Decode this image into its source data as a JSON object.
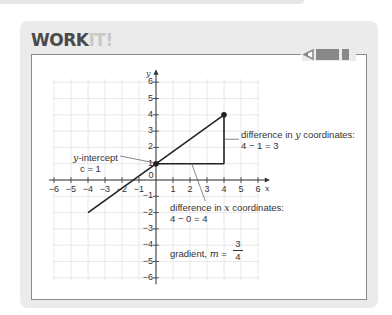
{
  "header": {
    "title_main": "WORK",
    "title_accent": "IT!"
  },
  "graph": {
    "x_axis_label": "x",
    "y_axis_label": "y",
    "x_ticks": [
      "−6",
      "−5",
      "−4",
      "−3",
      "−2",
      "−1",
      "0",
      "1",
      "2",
      "3",
      "4",
      "5",
      "6"
    ],
    "y_ticks": [
      "6",
      "5",
      "4",
      "3",
      "2",
      "1",
      "−1",
      "−2",
      "−3",
      "−4",
      "−5",
      "−6"
    ],
    "line_start": [
      -4,
      -2
    ],
    "line_end": [
      4,
      4
    ],
    "points": [
      [
        0,
        1
      ],
      [
        4,
        4
      ]
    ]
  },
  "annotations": {
    "y_intercept_line1": "y-intercept",
    "y_intercept_line2": "c = 1",
    "diff_y_line1": "difference in y coordinates:",
    "diff_y_line2": "4 − 1 = 3",
    "diff_x_line1": "difference in x coordinates:",
    "diff_x_line2": "4 − 0 = 4",
    "gradient_label": "gradient, m =",
    "gradient_num": "3",
    "gradient_den": "4"
  },
  "colors": {
    "card_bg": "#ebebeb",
    "title_dark": "#4a4a4a",
    "title_light": "#c9c9c9",
    "line": "#222222",
    "grid": "#e2e2e2"
  }
}
